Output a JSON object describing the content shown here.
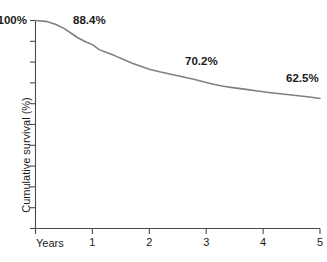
{
  "chart_data": {
    "type": "line",
    "title": "",
    "subtitle": "",
    "xlabel": "Years",
    "ylabel": "Cumulative survival (%)",
    "xlim": [
      0,
      5
    ],
    "ylim": [
      0,
      100
    ],
    "grid": false,
    "legend": "none",
    "x_ticks": [
      "1",
      "2",
      "3",
      "4",
      "5"
    ],
    "x_tick_values": [
      1,
      2,
      3,
      4,
      5
    ],
    "y_ticks_labeled": [
      "100%"
    ],
    "y_tick_values": [
      100,
      90,
      80,
      70,
      60,
      50,
      40,
      30,
      20,
      10,
      0
    ],
    "series": [
      {
        "name": "Cumulative survival",
        "x": [
          0.0,
          0.18,
          0.35,
          0.5,
          0.62,
          0.75,
          0.88,
          1.0,
          1.12,
          1.25,
          1.4,
          1.55,
          1.7,
          1.85,
          2.0,
          2.2,
          2.4,
          2.6,
          2.8,
          3.0,
          3.15,
          3.3,
          3.5,
          3.7,
          3.9,
          4.1,
          4.3,
          4.5,
          4.7,
          4.85,
          5.0
        ],
        "y": [
          100.0,
          99.6,
          98.2,
          96.2,
          94.0,
          91.6,
          89.8,
          88.4,
          86.0,
          84.6,
          83.0,
          81.2,
          79.4,
          78.0,
          76.6,
          75.2,
          74.0,
          72.8,
          71.6,
          70.2,
          69.2,
          68.4,
          67.6,
          66.9,
          66.1,
          65.4,
          64.8,
          64.2,
          63.6,
          63.1,
          62.5
        ]
      }
    ],
    "annotations": [
      {
        "label": "88.4%",
        "x": 1.0,
        "y": 88.4
      },
      {
        "label": "70.2%",
        "x": 3.0,
        "y": 70.2
      },
      {
        "label": "62.5%",
        "x": 5.0,
        "y": 62.5
      }
    ],
    "colors": {
      "curve": "#808082",
      "axis": "#4a4a4a",
      "text": "#1a1a1a",
      "background": "#ffffff"
    }
  }
}
